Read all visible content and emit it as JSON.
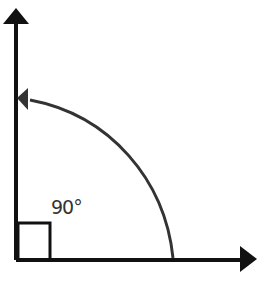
{
  "diagram": {
    "angle_label": "90°",
    "colors": {
      "axes": "#111111",
      "arc": "#333333",
      "background": "#ffffff"
    },
    "elements": [
      {
        "type": "ray",
        "direction": "up"
      },
      {
        "type": "ray",
        "direction": "right"
      },
      {
        "type": "arc-arrow",
        "from": "horizontal",
        "to": "vertical"
      },
      {
        "type": "right-angle-marker"
      }
    ]
  }
}
